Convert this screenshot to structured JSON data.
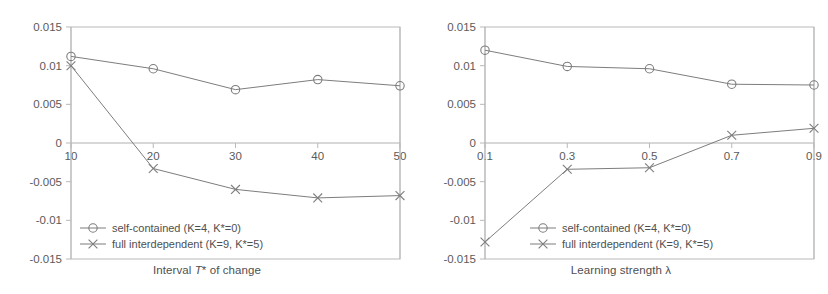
{
  "figure": {
    "background": "#ffffff",
    "line_color": "#7d7d7d",
    "axis_color": "#b9b9b9",
    "text_color": "#4f4f4f"
  },
  "chart_data": [
    {
      "type": "line",
      "title": "",
      "xlabel": "Interval T* of change",
      "xlabel_parts": {
        "pre": "Interval ",
        "italic": "T",
        "post": "* of change"
      },
      "ylabel": "",
      "x": [
        10,
        20,
        30,
        40,
        50
      ],
      "xtick_labels": [
        "10",
        "20",
        "30",
        "40",
        "50"
      ],
      "ytick_labels": [
        "0.015",
        "0.01",
        "0.005",
        "0",
        "-0.005",
        "-0.01",
        "-0.015"
      ],
      "ytick_values": [
        0.015,
        0.01,
        0.005,
        0,
        -0.005,
        -0.01,
        -0.015
      ],
      "ylim": [
        -0.015,
        0.015
      ],
      "xlim": [
        10,
        50
      ],
      "grid": false,
      "legend_position": "lower left",
      "series": [
        {
          "name": "self-contained (K=4, K*=0)",
          "marker": "circle",
          "values": [
            0.0112,
            0.0096,
            0.0069,
            0.0082,
            0.0074
          ]
        },
        {
          "name": "full interdependent (K=9, K*=5)",
          "marker": "x",
          "values": [
            0.01,
            -0.0033,
            -0.006,
            -0.0071,
            -0.0068
          ]
        }
      ]
    },
    {
      "type": "line",
      "title": "",
      "xlabel": "Learning strength λ",
      "xlabel_parts": {
        "pre": "Learning strength ",
        "italic": "",
        "post": "λ"
      },
      "ylabel": "",
      "x": [
        0.1,
        0.3,
        0.5,
        0.7,
        0.9
      ],
      "xtick_labels": [
        "0.1",
        "0.3",
        "0.5",
        "0.7",
        "0.9"
      ],
      "ytick_labels": [
        "0.015",
        "0.01",
        "0.005",
        "0",
        "-0.005",
        "-0.01",
        "-0.015"
      ],
      "ytick_values": [
        0.015,
        0.01,
        0.005,
        0,
        -0.005,
        -0.01,
        -0.015
      ],
      "ylim": [
        -0.015,
        0.015
      ],
      "xlim": [
        0.1,
        0.9
      ],
      "grid": false,
      "legend_position": "lower right",
      "series": [
        {
          "name": "self-contained (K=4, K*=0)",
          "marker": "circle",
          "values": [
            0.012,
            0.0099,
            0.0096,
            0.0076,
            0.0075
          ]
        },
        {
          "name": "full interdependent (K=9, K*=5)",
          "marker": "x",
          "values": [
            -0.0128,
            -0.0034,
            -0.0032,
            0.001,
            0.0019
          ]
        }
      ]
    }
  ]
}
